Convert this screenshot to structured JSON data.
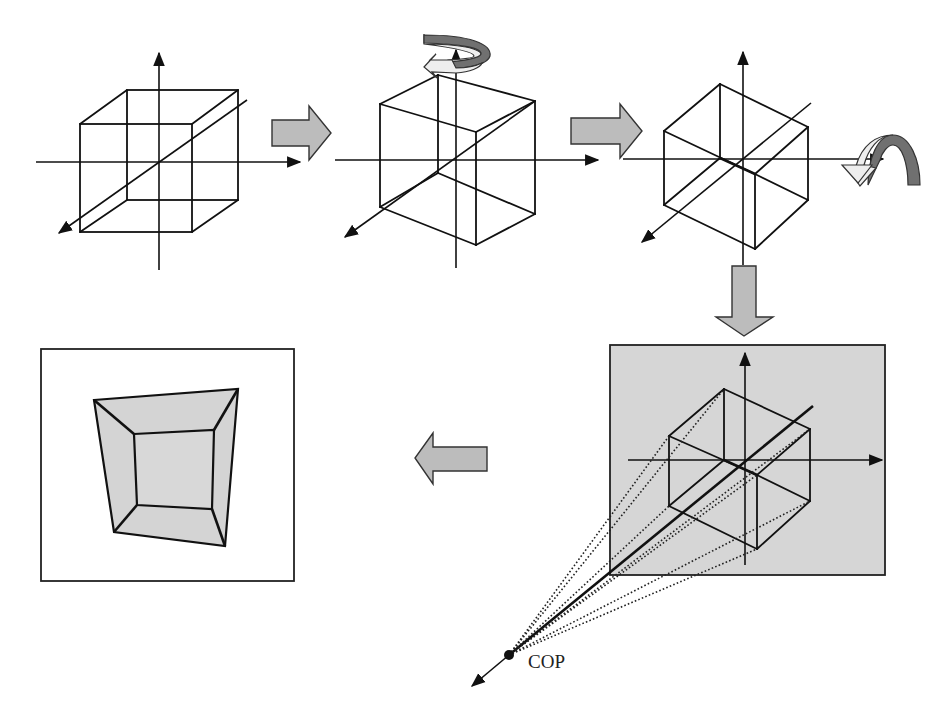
{
  "diagram": {
    "steps": [
      {
        "id": "step-1",
        "description": "Axis-aligned cube centered at origin"
      },
      {
        "id": "step-2",
        "description": "Cube rotated about the vertical axis"
      },
      {
        "id": "step-3",
        "description": "Cube rotated about the horizontal axis (hexagonal view)"
      },
      {
        "id": "step-4",
        "description": "Perspective projection from COP onto view plane"
      },
      {
        "id": "step-5",
        "description": "Resulting projected image on view plane"
      }
    ],
    "labels": {
      "cop": "COP"
    },
    "colors": {
      "line": "#111111",
      "arrow_fill": "#bcbcbc",
      "panel_fill": "#d6d6d6",
      "rotation_dark": "#707070",
      "rotation_light": "#eeeeee",
      "result_fill": "#d4d4d4"
    }
  }
}
